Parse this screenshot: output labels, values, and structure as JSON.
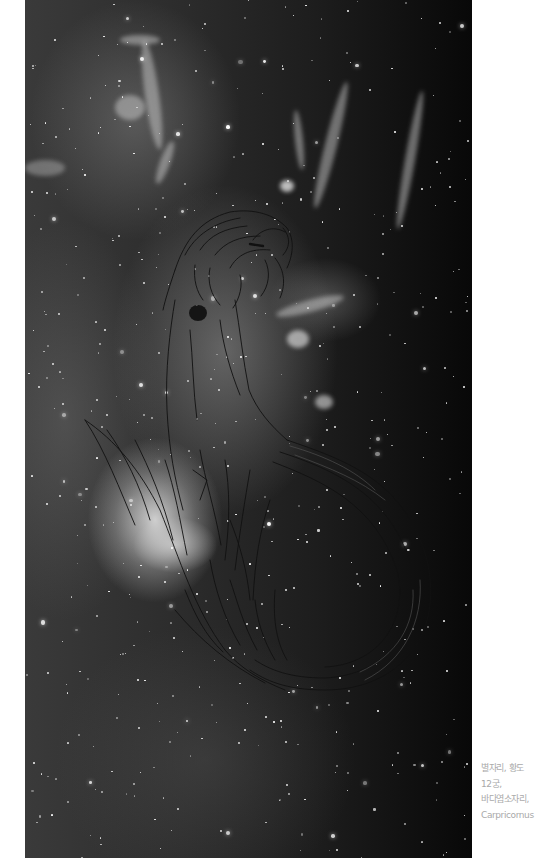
{
  "artwork": {
    "subject": "Mermaid line drawing over a grayscale nebula / star field photograph",
    "palette": {
      "background": "#ffffff",
      "space_dark": "#080808",
      "space_mid": "#2c2c2c",
      "nebula_glow": "#e8e8e8",
      "line_art": "#111111",
      "caption_text": "#a9a9a9"
    }
  },
  "caption": {
    "lines": [
      "별자리, 황도",
      "12궁,",
      "바다염소자리,",
      "Carpricornus"
    ]
  }
}
